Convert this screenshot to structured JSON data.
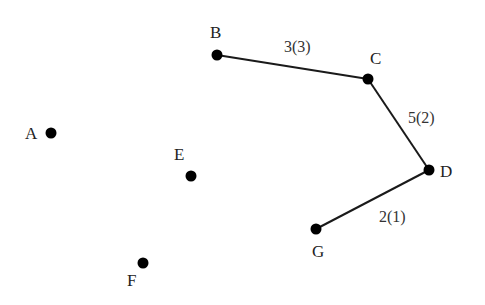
{
  "diagram": {
    "type": "graph",
    "colors": {
      "node": "#000000",
      "edge": "#1a1a1a",
      "text": "#222222",
      "background": "#ffffff"
    },
    "nodes": [
      {
        "id": "A",
        "label": "A",
        "x": 51,
        "y": 133,
        "lx": 25,
        "ly": 139
      },
      {
        "id": "B",
        "label": "B",
        "x": 217,
        "y": 55,
        "lx": 210,
        "ly": 38
      },
      {
        "id": "C",
        "label": "C",
        "x": 368,
        "y": 79,
        "lx": 370,
        "ly": 64
      },
      {
        "id": "D",
        "label": "D",
        "x": 429,
        "y": 170,
        "lx": 440,
        "ly": 177
      },
      {
        "id": "E",
        "label": "E",
        "x": 191,
        "y": 176,
        "lx": 174,
        "ly": 160
      },
      {
        "id": "F",
        "label": "F",
        "x": 143,
        "y": 263,
        "lx": 127,
        "ly": 286
      },
      {
        "id": "G",
        "label": "G",
        "x": 316,
        "y": 229,
        "lx": 312,
        "ly": 257
      }
    ],
    "edges": [
      {
        "from": "B",
        "to": "C",
        "label": "3(3)",
        "lx": 284,
        "ly": 52
      },
      {
        "from": "C",
        "to": "D",
        "label": "5(2)",
        "lx": 408,
        "ly": 123
      },
      {
        "from": "D",
        "to": "G",
        "label": "2(1)",
        "lx": 379,
        "ly": 222
      }
    ]
  }
}
